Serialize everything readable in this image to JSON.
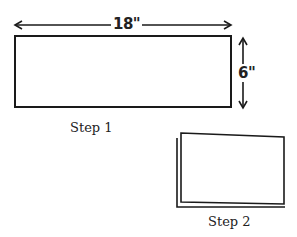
{
  "diagram": {
    "step1": {
      "label": "Step 1",
      "width_label": "18\"",
      "height_label": "6\""
    },
    "step2": {
      "label": "Step 2"
    },
    "stroke_color": "#1a1a1a"
  }
}
